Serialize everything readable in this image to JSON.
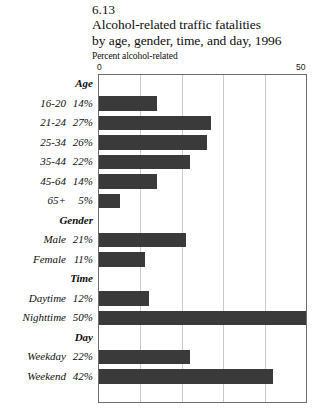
{
  "header": {
    "figure_number": "6.13",
    "title_line_1": "Alcohol-related traffic fatalities",
    "title_line_2": "by age, gender, time, and day, 1996",
    "subtitle": "Percent alcohol-related"
  },
  "axis": {
    "min_label": "0",
    "max_label": "50"
  },
  "colors": {
    "bar": "#3a3a3a",
    "gridline": "#c9c9c9",
    "frame": "#6b6b6b"
  },
  "rows": [
    {
      "type": "group",
      "label": "Age",
      "percent": "",
      "value": null
    },
    {
      "type": "bar",
      "label": "16-20",
      "percent": "14%",
      "value": 14
    },
    {
      "type": "bar",
      "label": "21-24",
      "percent": "27%",
      "value": 27
    },
    {
      "type": "bar",
      "label": "25-34",
      "percent": "26%",
      "value": 26
    },
    {
      "type": "bar",
      "label": "35-44",
      "percent": "22%",
      "value": 22
    },
    {
      "type": "bar",
      "label": "45-64",
      "percent": "14%",
      "value": 14
    },
    {
      "type": "bar",
      "label": "65+",
      "percent": "5%",
      "value": 5
    },
    {
      "type": "group",
      "label": "Gender",
      "percent": "",
      "value": null
    },
    {
      "type": "bar",
      "label": "Male",
      "percent": "21%",
      "value": 21
    },
    {
      "type": "bar",
      "label": "Female",
      "percent": "11%",
      "value": 11
    },
    {
      "type": "group",
      "label": "Time",
      "percent": "",
      "value": null
    },
    {
      "type": "bar",
      "label": "Daytime",
      "percent": "12%",
      "value": 12
    },
    {
      "type": "bar",
      "label": "Nighttime",
      "percent": "50%",
      "value": 50
    },
    {
      "type": "group",
      "label": "Day",
      "percent": "",
      "value": null
    },
    {
      "type": "bar",
      "label": "Weekday",
      "percent": "22%",
      "value": 22
    },
    {
      "type": "bar",
      "label": "Weekend",
      "percent": "42%",
      "value": 42
    }
  ],
  "chart_data": {
    "type": "bar",
    "orientation": "horizontal",
    "title": "6.13 Alcohol-related traffic fatalities by age, gender, time, and day, 1996",
    "xlabel": "Percent alcohol-related",
    "ylabel": "",
    "xlim": [
      0,
      50
    ],
    "xticks": [
      0,
      50
    ],
    "gridlines": [
      10,
      20,
      30,
      40
    ],
    "grid": true,
    "legend": false,
    "groups": [
      {
        "name": "Age",
        "categories": [
          "16-20",
          "21-24",
          "25-34",
          "35-44",
          "45-64",
          "65+"
        ],
        "values": [
          14,
          27,
          26,
          22,
          14,
          5
        ]
      },
      {
        "name": "Gender",
        "categories": [
          "Male",
          "Female"
        ],
        "values": [
          21,
          11
        ]
      },
      {
        "name": "Time",
        "categories": [
          "Daytime",
          "Nighttime"
        ],
        "values": [
          12,
          50
        ]
      },
      {
        "name": "Day",
        "categories": [
          "Weekday",
          "Weekend"
        ],
        "values": [
          22,
          42
        ]
      }
    ],
    "categories": [
      "16-20",
      "21-24",
      "25-34",
      "35-44",
      "45-64",
      "65+",
      "Male",
      "Female",
      "Daytime",
      "Nighttime",
      "Weekday",
      "Weekend"
    ],
    "values": [
      14,
      27,
      26,
      22,
      14,
      5,
      21,
      11,
      12,
      50,
      22,
      42
    ],
    "data_labels": [
      "14%",
      "27%",
      "26%",
      "22%",
      "14%",
      "5%",
      "21%",
      "11%",
      "12%",
      "50%",
      "22%",
      "42%"
    ]
  }
}
